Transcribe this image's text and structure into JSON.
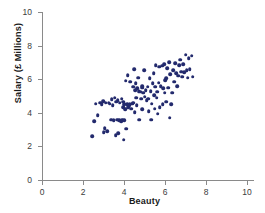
{
  "chart_data": {
    "type": "scatter",
    "title": "",
    "xlabel": "Beauty",
    "ylabel": "Salary (£ Millions)",
    "xlim": [
      0,
      10
    ],
    "ylim": [
      0,
      10
    ],
    "xticks": [
      0,
      2,
      4,
      6,
      8,
      10
    ],
    "yticks": [
      0,
      2,
      4,
      6,
      8,
      10
    ],
    "grid": false,
    "legend": null,
    "marker_color": "#232a6d",
    "axis_color": "#8a8a8a",
    "background_color": "#ffffff",
    "n_points": 120,
    "points": [
      [
        2.45,
        2.6
      ],
      [
        2.55,
        3.5
      ],
      [
        2.62,
        4.55
      ],
      [
        2.72,
        3.85
      ],
      [
        2.85,
        4.6
      ],
      [
        2.92,
        4.5
      ],
      [
        2.98,
        4.7
      ],
      [
        3.0,
        2.85
      ],
      [
        3.05,
        3.1
      ],
      [
        3.1,
        4.6
      ],
      [
        3.18,
        2.9
      ],
      [
        3.25,
        4.6
      ],
      [
        3.3,
        4.55
      ],
      [
        3.38,
        3.6
      ],
      [
        3.4,
        4.8
      ],
      [
        3.45,
        4.45
      ],
      [
        3.5,
        3.55
      ],
      [
        3.55,
        4.9
      ],
      [
        3.6,
        2.65
      ],
      [
        3.62,
        4.65
      ],
      [
        3.68,
        3.6
      ],
      [
        3.7,
        4.75
      ],
      [
        3.72,
        2.8
      ],
      [
        3.78,
        3.55
      ],
      [
        3.8,
        4.6
      ],
      [
        3.85,
        3.5
      ],
      [
        3.88,
        4.85
      ],
      [
        3.9,
        3.6
      ],
      [
        3.95,
        4.35
      ],
      [
        3.98,
        2.4
      ],
      [
        4.0,
        3.55
      ],
      [
        4.02,
        4.5
      ],
      [
        4.05,
        4.2
      ],
      [
        4.08,
        5.9
      ],
      [
        4.1,
        3.05
      ],
      [
        4.15,
        4.5
      ],
      [
        4.18,
        6.25
      ],
      [
        4.2,
        4.35
      ],
      [
        4.25,
        4.45
      ],
      [
        4.3,
        5.85
      ],
      [
        4.35,
        4.25
      ],
      [
        4.4,
        4.55
      ],
      [
        4.45,
        5.55
      ],
      [
        4.5,
        6.6
      ],
      [
        4.52,
        4.05
      ],
      [
        4.55,
        5.35
      ],
      [
        4.58,
        5.75
      ],
      [
        4.6,
        4.9
      ],
      [
        4.62,
        4.45
      ],
      [
        4.65,
        5.45
      ],
      [
        4.7,
        6.1
      ],
      [
        4.72,
        5.3
      ],
      [
        4.75,
        3.6
      ],
      [
        4.8,
        5.25
      ],
      [
        4.85,
        4.85
      ],
      [
        4.88,
        5.5
      ],
      [
        4.9,
        4.2
      ],
      [
        4.95,
        5.2
      ],
      [
        4.98,
        6.55
      ],
      [
        5.0,
        4.95
      ],
      [
        5.05,
        5.35
      ],
      [
        5.1,
        4.75
      ],
      [
        5.15,
        5.55
      ],
      [
        5.2,
        4.1
      ],
      [
        5.25,
        6.05
      ],
      [
        5.3,
        5.3
      ],
      [
        5.32,
        3.6
      ],
      [
        5.35,
        4.55
      ],
      [
        5.4,
        5.75
      ],
      [
        5.45,
        6.35
      ],
      [
        5.5,
        4.25
      ],
      [
        5.52,
        5.55
      ],
      [
        5.55,
        6.85
      ],
      [
        5.6,
        4.9
      ],
      [
        5.62,
        5.25
      ],
      [
        5.65,
        3.95
      ],
      [
        5.7,
        5.8
      ],
      [
        5.72,
        6.75
      ],
      [
        5.75,
        4.35
      ],
      [
        5.8,
        5.6
      ],
      [
        5.85,
        6.8
      ],
      [
        5.88,
        4.5
      ],
      [
        5.9,
        5.45
      ],
      [
        5.95,
        6.9
      ],
      [
        6.0,
        5.95
      ],
      [
        6.05,
        4.65
      ],
      [
        6.1,
        6.65
      ],
      [
        6.15,
        5.5
      ],
      [
        6.2,
        7.0
      ],
      [
        6.22,
        3.7
      ],
      [
        6.25,
        6.3
      ],
      [
        6.3,
        4.5
      ],
      [
        6.35,
        5.2
      ],
      [
        6.4,
        6.55
      ],
      [
        6.45,
        5.85
      ],
      [
        6.5,
        6.95
      ],
      [
        6.55,
        6.35
      ],
      [
        6.6,
        5.6
      ],
      [
        6.65,
        6.2
      ],
      [
        6.7,
        6.85
      ],
      [
        6.75,
        7.15
      ],
      [
        6.8,
        6.45
      ],
      [
        6.85,
        6.15
      ],
      [
        6.9,
        6.9
      ],
      [
        6.95,
        6.4
      ],
      [
        7.0,
        7.45
      ],
      [
        7.05,
        6.55
      ],
      [
        7.1,
        6.1
      ],
      [
        7.15,
        7.25
      ],
      [
        7.2,
        6.6
      ],
      [
        7.3,
        7.4
      ],
      [
        7.35,
        6.15
      ],
      [
        4.45,
        4.6
      ],
      [
        4.9,
        5.6
      ],
      [
        5.18,
        4.85
      ],
      [
        5.48,
        5.05
      ],
      [
        3.95,
        4.65
      ],
      [
        4.28,
        4.55
      ],
      [
        6.05,
        6.05
      ],
      [
        5.98,
        5.2
      ]
    ]
  }
}
